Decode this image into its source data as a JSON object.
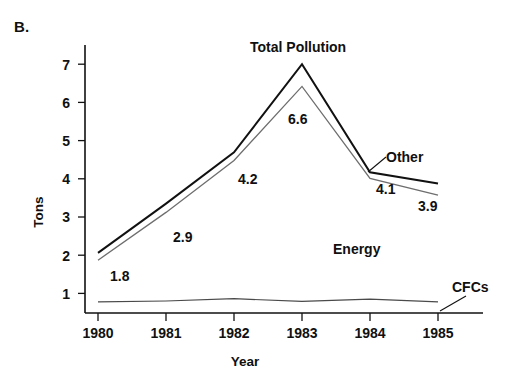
{
  "figure": {
    "panel_letter": "B.",
    "background": "#ffffff",
    "ink_color": "#111111"
  },
  "chart_data": {
    "type": "line",
    "title": "",
    "xlabel": "Year",
    "ylabel": "Tons",
    "x": [
      1980,
      1981,
      1982,
      1983,
      1984,
      1985
    ],
    "xtick_labels": [
      "1980",
      "1981",
      "1982",
      "1983",
      "1984",
      "1985"
    ],
    "ytick_labels": [
      "1",
      "2",
      "3",
      "4",
      "5",
      "6",
      "7"
    ],
    "yticks": [
      1,
      2,
      3,
      4,
      5,
      6,
      7
    ],
    "ylim": [
      0.48,
      7.6
    ],
    "xlim": [
      1979.6,
      1985.7
    ],
    "grid": false,
    "legend": "inline-annotations",
    "series": [
      {
        "name": "Total Pollution",
        "color": "#111111",
        "width": 2.0,
        "values": [
          2.06,
          3.35,
          4.69,
          7.0,
          4.17,
          3.88
        ]
      },
      {
        "name": "Energy",
        "color": "#6e6e6e",
        "width": 1.2,
        "values": [
          1.87,
          3.12,
          4.48,
          6.42,
          4.01,
          3.57
        ]
      },
      {
        "name": "CFCs",
        "color": "#4a4a4a",
        "width": 1.2,
        "values": [
          0.78,
          0.8,
          0.86,
          0.79,
          0.85,
          0.78
        ]
      }
    ],
    "annotations": [
      {
        "name": "total-pollution-label",
        "text": "Total Pollution",
        "x": 250,
        "y": 52,
        "anchor": "start"
      },
      {
        "name": "other-label",
        "text": "Other",
        "x": 371,
        "y": 159,
        "anchor": "start"
      },
      {
        "name": "energy-label",
        "text": "Energy",
        "x": 333,
        "y": 254,
        "anchor": "start"
      },
      {
        "name": "cfcs-label",
        "text": "CFCs",
        "x": 452,
        "y": 292,
        "anchor": "start"
      }
    ],
    "point_labels": [
      {
        "name": "value-label-1.8",
        "text": "1.8",
        "x": 110,
        "y": 281
      },
      {
        "name": "value-label-2.9",
        "text": "2.9",
        "x": 173,
        "y": 242
      },
      {
        "name": "value-label-4.2",
        "text": "4.2",
        "x": 238,
        "y": 184
      },
      {
        "name": "value-label-6.6",
        "text": "6.6",
        "x": 288,
        "y": 124
      },
      {
        "name": "value-label-4.1",
        "text": "4.1",
        "x": 376,
        "y": 194
      },
      {
        "name": "value-label-3.9",
        "text": "3.9",
        "x": 418,
        "y": 211
      }
    ]
  }
}
